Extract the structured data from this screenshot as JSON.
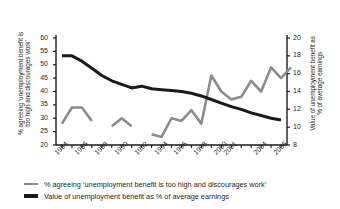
{
  "chart_data": {
    "type": "line",
    "title": "",
    "subtitle": "",
    "xlabel": "",
    "ylabel": "% agreeing ‘unemployment benefit is too high and discourages work’",
    "ylabel_right": "Value of unemployment benefit as % of average earnings",
    "x": [
      1984,
      1985,
      1986,
      1987,
      1988,
      1989,
      1990,
      1991,
      1992,
      1993,
      1994,
      1995,
      1996,
      1997,
      1998,
      1999,
      2000,
      2001,
      2002,
      2003,
      2004,
      2005,
      2006
    ],
    "xtick_labels": [
      "1984",
      "1986",
      "1988",
      "1990",
      "1992",
      "1994",
      "1996",
      "1998",
      "2000",
      "2001",
      "2004",
      "2006"
    ],
    "xtick_values": [
      1984,
      1986,
      1988,
      1990,
      1992,
      1994,
      1996,
      1998,
      2000,
      2001,
      2004,
      2006
    ],
    "xlim": [
      1983.4,
      2006.6
    ],
    "ylim": [
      20,
      60
    ],
    "ylim_right": [
      8,
      20
    ],
    "ytick_labels_left": [
      "60",
      "55",
      "50",
      "45",
      "40",
      "35",
      "30",
      "25",
      "20"
    ],
    "ytick_values_left": [
      60,
      55,
      50,
      45,
      40,
      35,
      30,
      25,
      20
    ],
    "ytick_labels_right": [
      "20",
      "18",
      "16",
      "14",
      "12",
      "10",
      "8"
    ],
    "ytick_values_right": [
      20,
      18,
      16,
      14,
      12,
      10,
      8
    ],
    "grid": false,
    "legend_position": "below",
    "series": [
      {
        "name": "% agreeing ‘unemployment benefit is too high and discourages work’",
        "axis": "left",
        "color": "#8c8c8c",
        "width": 2.6,
        "segments": [
          {
            "x": [
              1984,
              1985,
              1986,
              1987
            ],
            "values": [
              28,
              34,
              34,
              29
            ]
          },
          {
            "x": [
              1989,
              1990,
              1991
            ],
            "values": [
              27,
              30,
              27
            ]
          },
          {
            "x": [
              1993,
              1994,
              1995,
              1996,
              1997,
              1998,
              1999,
              2000,
              2001,
              2002,
              2003,
              2004,
              2005,
              2006
            ],
            "values": [
              24,
              23,
              30,
              29,
              33,
              28,
              46,
              40,
              37,
              38,
              44,
              40,
              49,
              45,
              49
            ]
          }
        ]
      },
      {
        "name": "Value of unemployment benefit as % of average earnings",
        "axis": "right",
        "color": "#1a1a1a",
        "width": 3.0,
        "x": [
          1984,
          1985,
          1986,
          1987,
          1988,
          1989,
          1990,
          1991,
          1992,
          1993,
          1994,
          1995,
          1996,
          1997,
          1998,
          1999,
          2000,
          2001,
          2002,
          2003,
          2004,
          2005,
          2006
        ],
        "values": [
          18.0,
          18.0,
          17.4,
          16.6,
          15.8,
          15.2,
          14.8,
          14.4,
          14.6,
          14.3,
          14.2,
          14.1,
          14.0,
          13.8,
          13.5,
          13.1,
          12.7,
          12.3,
          12.0,
          11.6,
          11.3,
          11.0,
          10.8
        ]
      }
    ],
    "legend": [
      {
        "label": "% agreeing ‘unemployment benefit is too high and discourages work’",
        "color": "#8c8c8c",
        "thickness": 2.6
      },
      {
        "label": "Value of unemployment benefit as % of average earnings",
        "color": "#1a1a1a",
        "thickness": 3.4
      }
    ]
  },
  "axes": {
    "left_title_line1": "% agreeing ‘unemployment benefit is",
    "left_title_line2": "too high and discourages work’",
    "right_title_line1": "Value of unemployment benefit as",
    "right_title_line2": "% of average earnings"
  },
  "colors": {
    "background": "#ffffff",
    "axis": "#1a1a1a",
    "text": "#231f20",
    "series_grey": "#8c8c8c",
    "series_black": "#1a1a1a"
  }
}
